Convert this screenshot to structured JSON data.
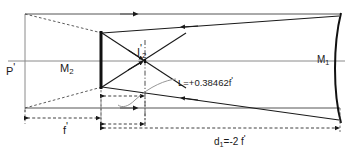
{
  "figure": {
    "type": "optical-ray-diagram",
    "width": 349,
    "height": 153,
    "background": "#ffffff",
    "ink": "#1a1a1a",
    "axis_color": "#7a7a7a"
  },
  "labels": {
    "principal_plane": {
      "text": "P",
      "prime": "'",
      "x": 6,
      "y": 63
    },
    "mirror2": {
      "text": "M",
      "sub": "2",
      "x": 60,
      "y": 63
    },
    "image2": {
      "text": "I",
      "sub": "2",
      "prime": "'",
      "x": 137,
      "y": 44
    },
    "mirror1": {
      "text": "M",
      "sub": "1",
      "x": 317,
      "y": 55
    },
    "back_focal": {
      "text": "L=+0.38462f",
      "prime": "'",
      "value": 0.38462,
      "x": 178,
      "y": 76
    },
    "focal_length": {
      "text": "f",
      "prime": "'",
      "x": 63,
      "y": 122
    },
    "separation": {
      "text": "d",
      "sub": "1",
      "tail": "=-2 f",
      "prime": "'",
      "value": -2,
      "x": 214,
      "y": 133
    }
  },
  "geometry": {
    "optical_axis_y": 61,
    "upper_ray_y": 14,
    "lower_ray_y": 108,
    "plane_P_x": 25,
    "mirror2_x": 101,
    "image2_x": 145,
    "mirror1_x": 340,
    "mirror2_top_y": 32,
    "mirror2_bottom_y": 88,
    "mirror1_top_y": 14,
    "mirror1_bottom_y": 122
  },
  "dimensions": [
    {
      "name": "f-prime",
      "from_x": 25,
      "to_x": 101,
      "y": 118,
      "label": "f'"
    },
    {
      "name": "L",
      "from_x": 101,
      "to_x": 145,
      "y": 96,
      "label": "L=+0.38462f'"
    },
    {
      "name": "L-lower",
      "from_x": 101,
      "to_x": 145,
      "y": 124,
      "label": ""
    },
    {
      "name": "d1",
      "from_x": 101,
      "to_x": 340,
      "y": 128,
      "label": "d1=-2 f'"
    }
  ]
}
